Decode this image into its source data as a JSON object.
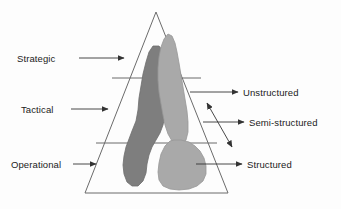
{
  "figure": {
    "kind": "pyramid-diagram",
    "title_text": "",
    "background_color": "#fdfdfd",
    "line_color": "#555555",
    "text_color": "#222222"
  },
  "pyramid": {
    "apex": {
      "x": 156,
      "y": 12
    },
    "base_left": {
      "x": 85,
      "y": 193
    },
    "base_right": {
      "x": 228,
      "y": 193
    },
    "divider_lines_y": [
      78,
      143
    ],
    "tiers": [
      {
        "level": 1,
        "label": "Strategic"
      },
      {
        "level": 2,
        "label": "Tactical"
      },
      {
        "level": 3,
        "label": "Operational"
      }
    ]
  },
  "left_labels": [
    {
      "id": "strategic",
      "label": "Strategic",
      "arrow_from_x": 79,
      "arrow_to_x": 124,
      "y": 58
    },
    {
      "id": "tactical",
      "label": "Tactical",
      "arrow_from_x": 71,
      "arrow_to_x": 108,
      "y": 109
    },
    {
      "id": "operational",
      "label": "Operational",
      "arrow_from_x": 73,
      "arrow_to_x": 96,
      "y": 164
    }
  ],
  "right_labels": [
    {
      "id": "unstructured",
      "label": "Unstructured",
      "arrow_from_x": 190,
      "arrow_to_x": 238,
      "y": 92
    },
    {
      "id": "semi-structured",
      "label": "Semi-structured",
      "arrow_from_x": 203,
      "arrow_to_x": 244,
      "y": 122
    },
    {
      "id": "structured",
      "label": "Structured",
      "arrow_from_x": 196,
      "arrow_to_x": 242,
      "y": 164
    }
  ],
  "range_arrow": {
    "id": "structure-continuum",
    "description": "double-headed arrow",
    "from": {
      "x": 207,
      "y": 103
    },
    "to": {
      "x": 232,
      "y": 147
    }
  },
  "regions": [
    {
      "id": "unstructured-region",
      "name": "dark-gray-blob",
      "fill": "#7e7e7e",
      "stroke": "#6a6a6a",
      "path": "M 153 46 L 149 52 L 146 62 L 143 74 L 141 86 L 139 98 L 138 110 L 136 121 L 132 131 L 129 139 L 126 147 L 124 156 L 123 165 L 124 174 L 127 182 L 132 186 L 138 186 L 143 181 L 146 173 L 147 164 L 149 155 L 152 147 L 156 140 L 160 133 L 163 125 L 165 115 L 166 104 L 167 92 L 168 80 L 168 68 L 166 58 L 163 51 L 159 46 Z"
    },
    {
      "id": "semi-structured-region",
      "name": "light-gray-upper-blob",
      "fill": "#a9a9a9",
      "stroke": "#959595",
      "path": "M 168 34 L 164 39 L 161 47 L 159 57 L 158 68 L 158 80 L 159 92 L 161 104 L 163 115 L 165 125 L 168 134 L 172 141 L 177 145 L 182 145 L 186 140 L 188 132 L 188 122 L 187 111 L 185 99 L 183 87 L 181 75 L 179 63 L 177 52 L 175 43 L 172 36 Z"
    },
    {
      "id": "structured-region",
      "name": "light-gray-lower-blob",
      "fill": "#a9a9a9",
      "stroke": "#959595",
      "path": "M 170 141 L 165 146 L 161 154 L 159 163 L 158 172 L 159 180 L 163 186 L 170 189 L 179 190 L 189 189 L 197 186 L 203 181 L 206 174 L 206 166 L 204 158 L 200 151 L 195 146 L 189 142 L 181 140 L 174 140 Z"
    }
  ],
  "colors": {
    "dark_gray": "#7e7e7e",
    "light_gray": "#a9a9a9",
    "outline": "#555555",
    "text": "#222222"
  }
}
